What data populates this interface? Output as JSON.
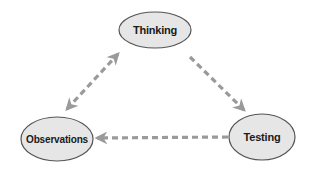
{
  "diagram": {
    "type": "cycle",
    "colors": {
      "background": "#ffffff",
      "node_fill": "#e6e6e6",
      "node_stroke": "#555555",
      "arrow": "#9a9a9a",
      "label": "#1a1a1a"
    },
    "nodes": [
      {
        "id": "thinking",
        "label": "Thinking",
        "cx": 155,
        "cy": 30,
        "rx": 36,
        "ry": 18
      },
      {
        "id": "testing",
        "label": "Testing",
        "cx": 262,
        "cy": 137,
        "rx": 33,
        "ry": 23
      },
      {
        "id": "observations",
        "label": "Observations",
        "cx": 57,
        "cy": 139,
        "rx": 36,
        "ry": 22
      }
    ],
    "edges": [
      {
        "from": "thinking",
        "to": "testing",
        "style": "dashed",
        "direction": "forward"
      },
      {
        "from": "testing",
        "to": "observations",
        "style": "dashed",
        "direction": "forward"
      },
      {
        "from": "observations",
        "to": "thinking",
        "style": "dashed",
        "direction": "both"
      }
    ]
  }
}
